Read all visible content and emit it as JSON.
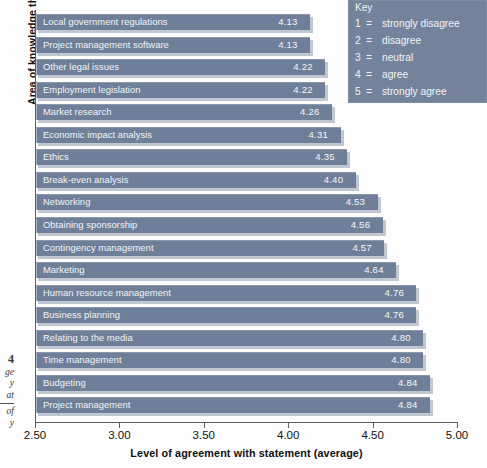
{
  "figure": {
    "margin_caption_number": "4",
    "margin_caption_lines": [
      "ge",
      "y",
      "at"
    ],
    "margin_caption_lines_2": [
      "of",
      "y"
    ]
  },
  "key": {
    "title": "Key",
    "rows": [
      {
        "num": "1",
        "eq": "=",
        "text": "strongly disagree"
      },
      {
        "num": "2",
        "eq": "=",
        "text": "disagree"
      },
      {
        "num": "3",
        "eq": "=",
        "text": "neutral"
      },
      {
        "num": "4",
        "eq": "=",
        "text": "agree"
      },
      {
        "num": "5",
        "eq": "=",
        "text": "strongly agree"
      }
    ]
  },
  "colors": {
    "bar_fill": "#6f7f99",
    "bar_edge": "#aab6c9",
    "key_background": "#74839b",
    "bar_text": "#f2f4f8",
    "axis": "#5a5f66"
  },
  "chart_data": {
    "type": "bar",
    "orientation": "horizontal",
    "title": "",
    "xlabel": "Level of agreement with statement (average)",
    "ylabel": "Area of knowledge that event managers require",
    "xlim": [
      2.5,
      5.0
    ],
    "xticks": [
      "2.50",
      "3.00",
      "3.50",
      "4.00",
      "4.50",
      "5.00"
    ],
    "xtick_values": [
      2.5,
      3.0,
      3.5,
      4.0,
      4.5,
      5.0
    ],
    "grid": false,
    "legend_position": "top-right",
    "value_labels_inside_bars": true,
    "categories": [
      "Local government regulations",
      "Project management software",
      "Other legal issues",
      "Employment legislation",
      "Market research",
      "Economic impact analysis",
      "Ethics",
      "Break-even analysis",
      "Networking",
      "Obtaining sponsorship",
      "Contingency management",
      "Marketing",
      "Human resource management",
      "Business planning",
      "Relating to the media",
      "Time management",
      "Budgeting",
      "Project management"
    ],
    "values": [
      4.13,
      4.13,
      4.22,
      4.22,
      4.26,
      4.31,
      4.35,
      4.4,
      4.53,
      4.56,
      4.57,
      4.64,
      4.76,
      4.76,
      4.8,
      4.8,
      4.84,
      4.84
    ],
    "value_labels": [
      "4.13",
      "4.13",
      "4.22",
      "4.22",
      "4.26",
      "4.31",
      "4.35",
      "4.40",
      "4.53",
      "4.56",
      "4.57",
      "4.64",
      "4.76",
      "4.76",
      "4.80",
      "4.80",
      "4.84",
      "4.84"
    ]
  }
}
